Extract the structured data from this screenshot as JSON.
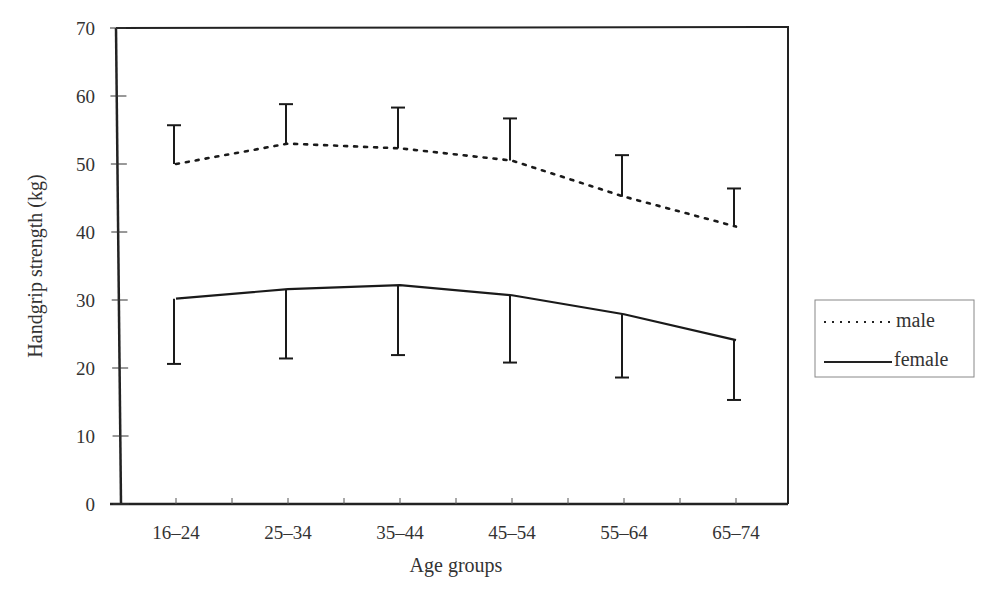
{
  "chart_data": {
    "type": "line",
    "title": "",
    "xlabel": "Age groups",
    "ylabel": "Handgrip strength (kg)",
    "ylim": [
      0,
      70
    ],
    "yticks": [
      0,
      10,
      20,
      30,
      40,
      50,
      60,
      70
    ],
    "ytick_labels": [
      "0",
      "10",
      "20",
      "30",
      "40",
      "50",
      "60",
      "70"
    ],
    "categories": [
      "16–24",
      "25–34",
      "35–44",
      "45–54",
      "55–64",
      "65–74"
    ],
    "grid": false,
    "legend_position": "right",
    "series": [
      {
        "name": "male",
        "line_style": "dotted",
        "values": [
          50.0,
          53.0,
          52.3,
          50.5,
          45.2,
          40.8
        ],
        "error_upper": [
          55.7,
          58.8,
          58.3,
          56.7,
          51.3,
          46.4
        ]
      },
      {
        "name": "female",
        "line_style": "solid",
        "values": [
          30.2,
          31.6,
          32.2,
          30.7,
          27.9,
          24.1
        ],
        "error_lower": [
          20.6,
          21.4,
          21.9,
          20.8,
          18.6,
          15.3
        ]
      }
    ]
  },
  "legend": {
    "items": [
      {
        "label": "male",
        "style": "dotted"
      },
      {
        "label": "female",
        "style": "solid"
      }
    ]
  },
  "colors": {
    "line": "#1a1a1a",
    "frame": "#222222",
    "text": "#333333"
  }
}
